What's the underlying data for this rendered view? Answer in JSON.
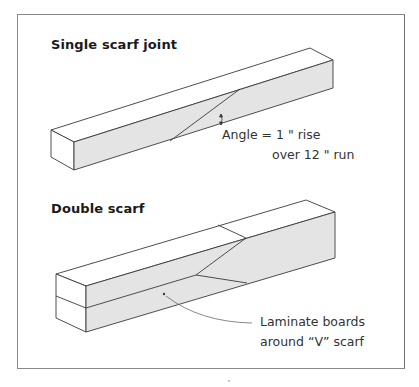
{
  "figure": {
    "panels": [
      {
        "title": "Single scarf joint",
        "annotation": {
          "line1": "Angle = 1 \" rise",
          "line2": "over 12 \" run"
        }
      },
      {
        "title": "Double scarf",
        "annotation": {
          "line1": "Laminate boards",
          "line2": "around “V” scarf"
        }
      }
    ],
    "colors": {
      "face_fill": "#e4e4e4",
      "top_fill": "#ffffff",
      "stroke": "#3a3a3a",
      "frame": "#8a8a8a"
    }
  }
}
